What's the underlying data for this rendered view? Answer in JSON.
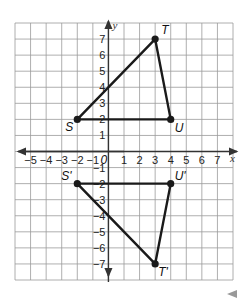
{
  "diagram": {
    "type": "coordinate-grid",
    "x_range": [
      -6,
      8
    ],
    "y_range": [
      -8,
      8
    ],
    "x_axis_label": "x",
    "y_axis_label": "y",
    "x_tick_labels": [
      "-5",
      "-4",
      "-3",
      "-2",
      "-1",
      "1",
      "2",
      "3",
      "4",
      "5",
      "6",
      "7"
    ],
    "y_tick_labels_positive": [
      "1",
      "2",
      "3",
      "4",
      "5",
      "6",
      "7"
    ],
    "y_tick_labels_negative": [
      "-1",
      "-2",
      "-3",
      "-4",
      "-5",
      "-6",
      "-7"
    ],
    "origin_label": "0",
    "colors": {
      "grid": "#9a9a9a",
      "axes": "#333333",
      "shape": "#1a1a1a",
      "background": "#ffffff"
    }
  },
  "triangles": [
    {
      "name": "STU",
      "vertices": [
        {
          "label": "S",
          "x": -2,
          "y": 2
        },
        {
          "label": "T",
          "x": 3,
          "y": 7
        },
        {
          "label": "U",
          "x": 4,
          "y": 2
        }
      ]
    },
    {
      "name": "S'T'U'",
      "vertices": [
        {
          "label": "S'",
          "x": -2,
          "y": -2
        },
        {
          "label": "T'",
          "x": 3,
          "y": -7
        },
        {
          "label": "U'",
          "x": 4,
          "y": -2
        }
      ]
    }
  ],
  "nav": {
    "icon": "left-arrow-icon"
  }
}
